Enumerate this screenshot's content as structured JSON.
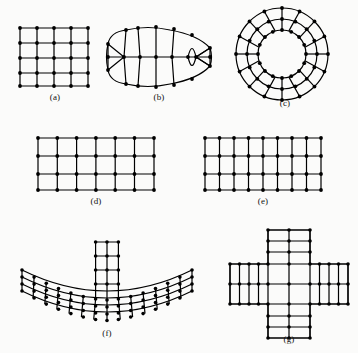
{
  "figure": {
    "kind": "finite-element-mesh-plate",
    "background_color": "#fbfbfa",
    "ink_color": "#000000",
    "node_color": "#000000",
    "panel_count": 7,
    "captions": [
      "(a)",
      "(b)",
      "(c)",
      "(d)",
      "(e)",
      "(f)",
      "(g)"
    ],
    "panels": [
      {
        "id": "a",
        "caption": "(a)",
        "shape": "square-structured-grid",
        "description": "Uniform square quadrilateral mesh",
        "cols_nodes": 5,
        "rows_nodes": 5,
        "cells_x": 4,
        "cells_y": 4,
        "node_count": 25
      },
      {
        "id": "b",
        "caption": "(b)",
        "shape": "lens-eye-mapped-mesh",
        "description": "Lens shaped region with fan elements converging at both pointed ends",
        "cols_nodes": 9,
        "rows_nodes": 3,
        "node_count": 23
      },
      {
        "id": "c",
        "caption": "(c)",
        "shape": "annulus-polar-mesh",
        "description": "Annular ring mesh with radial spokes and concentric circumferential rings",
        "rings": 3,
        "spokes": 16,
        "node_count": 48
      },
      {
        "id": "d",
        "caption": "(d)",
        "shape": "rectangular-structured-grid",
        "description": "Coarse rectangular quadrilateral mesh",
        "cols_nodes": 7,
        "rows_nodes": 4,
        "cells_x": 6,
        "cells_y": 3,
        "node_count": 28
      },
      {
        "id": "e",
        "caption": "(e)",
        "shape": "rectangular-graded-grid",
        "description": "Rectangular mesh with finer vertical subdivision",
        "cols_nodes": 9,
        "rows_nodes": 4,
        "cells_x": 8,
        "cells_y": 3,
        "node_count": 36
      },
      {
        "id": "f",
        "caption": "(f)",
        "shape": "curved-arc-band-with-stub",
        "description": "Curved arc shaped band mesh with a rectangular block protruding upward from the centre",
        "cols_nodes": 15,
        "rows_nodes": 4,
        "stub_cols_nodes": 3,
        "stub_rows_nodes": 4,
        "node_count": 69
      },
      {
        "id": "g",
        "caption": "(g)",
        "shape": "cross-plus-mesh",
        "description": "Plus or cross shaped region meshed with quadrilateral elements",
        "arm_cells": 4,
        "center_cells": 3,
        "node_count": 77
      }
    ]
  }
}
